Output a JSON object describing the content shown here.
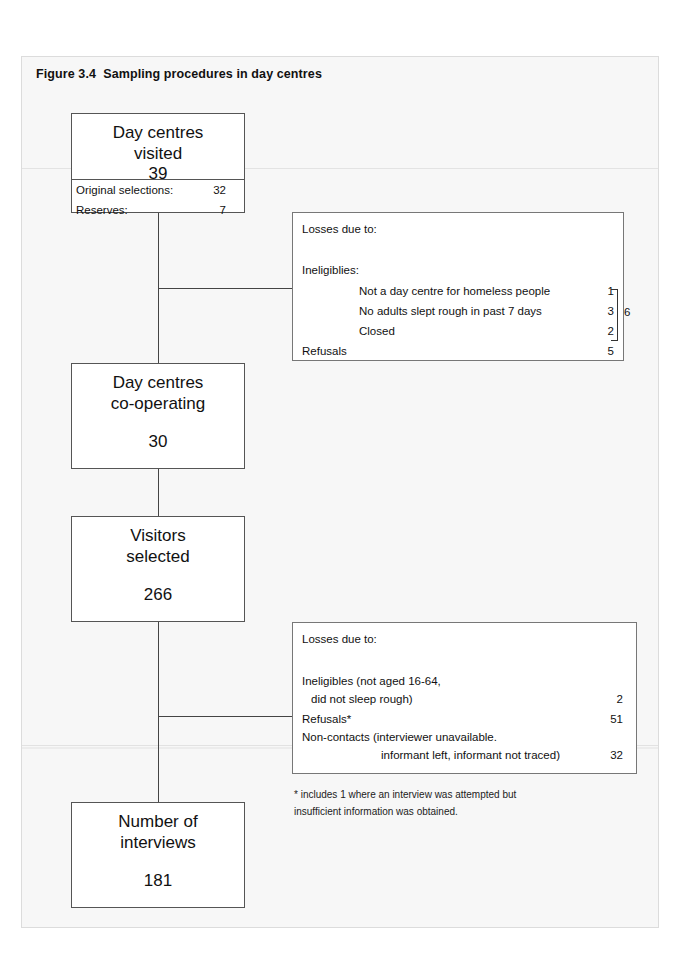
{
  "figure": {
    "title": "Figure 3.4  Sampling procedures in day centres"
  },
  "flow": {
    "box_visited": {
      "line1": "Day centres",
      "line2": "visited",
      "number": "39",
      "sub_rows": [
        {
          "label": "Original selections:",
          "value": "32"
        },
        {
          "label": "Reserves:",
          "value": "7"
        }
      ]
    },
    "box_cooperating": {
      "line1": "Day centres",
      "line2": "co-operating",
      "number": "30"
    },
    "box_visitors": {
      "line1": "Visitors",
      "line2": "selected",
      "number": "266"
    },
    "box_interviews": {
      "line1": "Number of",
      "line2": "interviews",
      "number": "181"
    }
  },
  "losses_centres": {
    "heading": "Losses due to:",
    "subheading": "Ineligiblies:",
    "rows": [
      {
        "label": "Not a day centre for homeless people",
        "value": "1",
        "indent": "deep"
      },
      {
        "label": "No adults slept rough in past 7 days",
        "value": "3",
        "indent": "deep"
      },
      {
        "label": "Closed",
        "value": "2",
        "indent": "deep"
      },
      {
        "label": "Refusals",
        "value": "5",
        "indent": "none"
      }
    ],
    "bracket_total": "6"
  },
  "losses_visitors": {
    "heading": "Losses due to:",
    "rows": [
      {
        "label": "Ineligibles (not aged 16-64,",
        "value": "",
        "indent": "none"
      },
      {
        "label": "did not sleep rough)",
        "value": "2",
        "indent": "small"
      },
      {
        "label": "Refusals*",
        "value": "51",
        "indent": "none"
      },
      {
        "label": "Non-contacts (interviewer unavailable.",
        "value": "",
        "indent": "none"
      },
      {
        "label": "informant left, informant not traced)",
        "value": "32",
        "indent": "deep"
      }
    ]
  },
  "footnote": {
    "line1": "* includes 1 where an interview was attempted but",
    "line2": "insufficient information was obtained."
  },
  "chart_data": {
    "type": "diagram",
    "title": "Figure 3.4  Sampling procedures in day centres",
    "nodes": [
      {
        "id": "visited",
        "label": "Day centres visited",
        "value": 39
      },
      {
        "id": "cooperating",
        "label": "Day centres co-operating",
        "value": 30
      },
      {
        "id": "visitors",
        "label": "Visitors selected",
        "value": 266
      },
      {
        "id": "interviews",
        "label": "Number of interviews",
        "value": 181
      }
    ],
    "breakdowns": [
      {
        "node": "visited",
        "items": [
          {
            "label": "Original selections",
            "value": 32
          },
          {
            "label": "Reserves",
            "value": 7
          }
        ]
      },
      {
        "node": "visited->cooperating",
        "label": "Losses due to",
        "items": [
          {
            "label": "Not a day centre for homeless people",
            "value": 1
          },
          {
            "label": "No adults slept rough in past 7 days",
            "value": 3
          },
          {
            "label": "Closed",
            "value": 2
          },
          {
            "label": "Ineligiblies total",
            "value": 6
          },
          {
            "label": "Refusals",
            "value": 5
          }
        ]
      },
      {
        "node": "visitors->interviews",
        "label": "Losses due to",
        "items": [
          {
            "label": "Ineligibles (not aged 16-64, did not sleep rough)",
            "value": 2
          },
          {
            "label": "Refusals*",
            "value": 51
          },
          {
            "label": "Non-contacts (interviewer unavailable. informant left, informant not traced)",
            "value": 32
          }
        ]
      }
    ]
  }
}
